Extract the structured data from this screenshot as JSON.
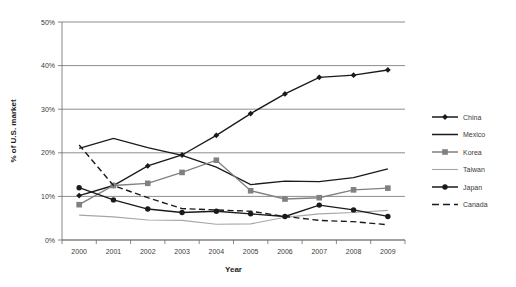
{
  "chart_data": {
    "type": "line",
    "title": "",
    "xlabel": "Year",
    "ylabel": "% of U.S. market",
    "categories": [
      "2000",
      "2001",
      "2002",
      "2003",
      "2004",
      "2005",
      "2006",
      "2007",
      "2008",
      "2009"
    ],
    "x": [
      2000,
      2001,
      2002,
      2003,
      2004,
      2005,
      2006,
      2007,
      2008,
      2009
    ],
    "ylim": [
      0,
      50
    ],
    "yticks": [
      0,
      10,
      20,
      30,
      40,
      50
    ],
    "ytick_labels": [
      "0%",
      "10%",
      "20%",
      "30%",
      "40%",
      "50%"
    ],
    "grid": "horizontal",
    "legend_position": "right",
    "series": [
      {
        "name": "China",
        "marker": "diamond",
        "color": "#1a1a1a",
        "dash": "solid",
        "values": [
          10.2,
          12.5,
          17.0,
          19.5,
          24.0,
          29.0,
          33.5,
          37.3,
          37.8,
          39.0
        ]
      },
      {
        "name": "Mexico",
        "marker": "none",
        "color": "#1a1a1a",
        "dash": "solid",
        "values": [
          21.0,
          23.3,
          21.2,
          19.4,
          16.7,
          12.7,
          13.5,
          13.4,
          14.3,
          16.3
        ]
      },
      {
        "name": "Korea",
        "marker": "square",
        "color": "#808080",
        "dash": "solid",
        "values": [
          8.1,
          12.5,
          13.0,
          15.5,
          18.3,
          11.3,
          9.4,
          9.7,
          11.5,
          11.9
        ]
      },
      {
        "name": "Taiwan",
        "marker": "none",
        "color": "#a6a6a6",
        "dash": "solid",
        "values": [
          5.7,
          5.3,
          4.6,
          4.5,
          3.6,
          3.7,
          5.2,
          6.0,
          6.3,
          6.8
        ]
      },
      {
        "name": "Japan",
        "marker": "circle",
        "color": "#1a1a1a",
        "dash": "solid",
        "values": [
          12.0,
          9.2,
          7.1,
          6.3,
          6.6,
          6.0,
          5.4,
          8.0,
          6.9,
          5.4
        ]
      },
      {
        "name": "Canada",
        "marker": "none",
        "color": "#1a1a1a",
        "dash": "dashed",
        "values": [
          21.8,
          12.5,
          9.7,
          7.2,
          6.9,
          6.6,
          5.4,
          4.5,
          4.2,
          3.5
        ]
      }
    ]
  },
  "legend": {
    "entries": [
      {
        "label": "China"
      },
      {
        "label": "Mexico"
      },
      {
        "label": "Korea"
      },
      {
        "label": "Taiwan"
      },
      {
        "label": "Japan"
      },
      {
        "label": "Canada"
      }
    ]
  }
}
